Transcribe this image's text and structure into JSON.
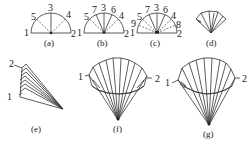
{
  "panels": {
    "a": {
      "caption": "(a)",
      "labels": [
        "1",
        "5",
        "3",
        "4",
        "2"
      ]
    },
    "b": {
      "caption": "(b)",
      "labels": [
        "1",
        "5",
        "7",
        "3",
        "6",
        "4",
        "2"
      ]
    },
    "c": {
      "caption": "(c)",
      "labels": [
        "1",
        "9",
        "5",
        "7",
        "3",
        "6",
        "4",
        "8",
        "2"
      ]
    },
    "d": {
      "caption": "(d)"
    },
    "e": {
      "caption": "(e)",
      "labels": [
        "2",
        "1"
      ]
    },
    "f": {
      "caption": "(f)",
      "labels": [
        "1",
        "2"
      ]
    },
    "g": {
      "caption": "(g)",
      "labels": [
        "1",
        "2"
      ]
    }
  },
  "colors": {
    "line": "#333333",
    "text": "#222222",
    "background": "#ffffff"
  }
}
